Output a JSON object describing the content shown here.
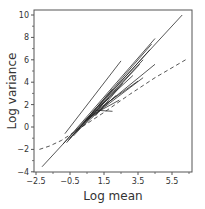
{
  "chart_data": {
    "type": "line",
    "title": "",
    "xlabel": "Log mean",
    "ylabel": "Log variance",
    "xlim": [
      -2.5,
      6.6
    ],
    "ylim": [
      -4,
      10.4
    ],
    "xticks": [
      -2.5,
      -0.5,
      1.5,
      3.5,
      5.5
    ],
    "xtick_labels": [
      "−2.5",
      "−0.5",
      "1.5",
      "3.5",
      "5.5"
    ],
    "xminor_ticks": [
      -1.5,
      0.5,
      2.5,
      4.5,
      6.5
    ],
    "yticks": [
      -4,
      -2,
      0,
      2,
      4,
      6,
      8,
      10
    ],
    "ytick_labels": [
      "−4",
      "−2",
      "0",
      "2",
      "4",
      "6",
      "8",
      "10"
    ],
    "yminor_ticks": [
      -3,
      -1,
      1,
      3,
      5,
      7,
      9
    ],
    "grid": false,
    "legend": null,
    "reference_lines": [
      {
        "name": "solid reference line",
        "style": "solid",
        "x": [
          -2.15,
          6.1
        ],
        "y": [
          -3.55,
          10.0
        ]
      },
      {
        "name": "dashed curve",
        "style": "dashed",
        "x": [
          -2.3,
          -1.7,
          -1.0,
          0.0,
          1.5,
          3.0,
          4.5,
          6.3
        ],
        "y": [
          -2.0,
          -1.7,
          -1.2,
          -0.2,
          1.3,
          2.9,
          4.4,
          6.0
        ]
      }
    ],
    "series": [
      {
        "name": "segment 1",
        "x": [
          -0.8,
          2.5
        ],
        "y": [
          -0.6,
          5.9
        ]
      },
      {
        "name": "segment 2",
        "x": [
          -0.9,
          4.5
        ],
        "y": [
          -1.5,
          7.9
        ]
      },
      {
        "name": "segment 3",
        "x": [
          -0.6,
          4.3
        ],
        "y": [
          -1.2,
          7.4
        ]
      },
      {
        "name": "segment 4",
        "x": [
          -0.5,
          4.2
        ],
        "y": [
          -1.0,
          6.9
        ]
      },
      {
        "name": "segment 5",
        "x": [
          0.0,
          3.8
        ],
        "y": [
          -0.2,
          6.0
        ]
      },
      {
        "name": "segment 6",
        "x": [
          -0.3,
          3.6
        ],
        "y": [
          -0.8,
          5.6
        ]
      },
      {
        "name": "segment 7",
        "x": [
          0.3,
          4.5
        ],
        "y": [
          0.4,
          5.6
        ]
      },
      {
        "name": "segment 8",
        "x": [
          0.5,
          3.8
        ],
        "y": [
          0.6,
          4.4
        ]
      },
      {
        "name": "segment 9",
        "x": [
          0.8,
          3.5
        ],
        "y": [
          1.2,
          4.1
        ]
      },
      {
        "name": "segment 10",
        "x": [
          1.0,
          2.6
        ],
        "y": [
          1.0,
          3.9
        ]
      },
      {
        "name": "segment 11",
        "x": [
          -0.7,
          2.0
        ],
        "y": [
          -1.4,
          3.4
        ]
      },
      {
        "name": "segment 12",
        "x": [
          0.2,
          2.2
        ],
        "y": [
          0.0,
          2.8
        ]
      },
      {
        "name": "segment 13",
        "x": [
          1.2,
          3.2
        ],
        "y": [
          1.8,
          4.6
        ]
      },
      {
        "name": "segment 14",
        "x": [
          0.6,
          2.4
        ],
        "y": [
          0.9,
          2.4
        ]
      },
      {
        "name": "segment 15",
        "x": [
          1.0,
          2.0
        ],
        "y": [
          1.5,
          1.4
        ]
      },
      {
        "name": "segment 16",
        "x": [
          -0.2,
          1.8
        ],
        "y": [
          -0.5,
          2.6
        ]
      }
    ]
  },
  "colors": {
    "frame": "#555555",
    "lines": "#222222",
    "reference": "#444444",
    "text": "#333333"
  }
}
